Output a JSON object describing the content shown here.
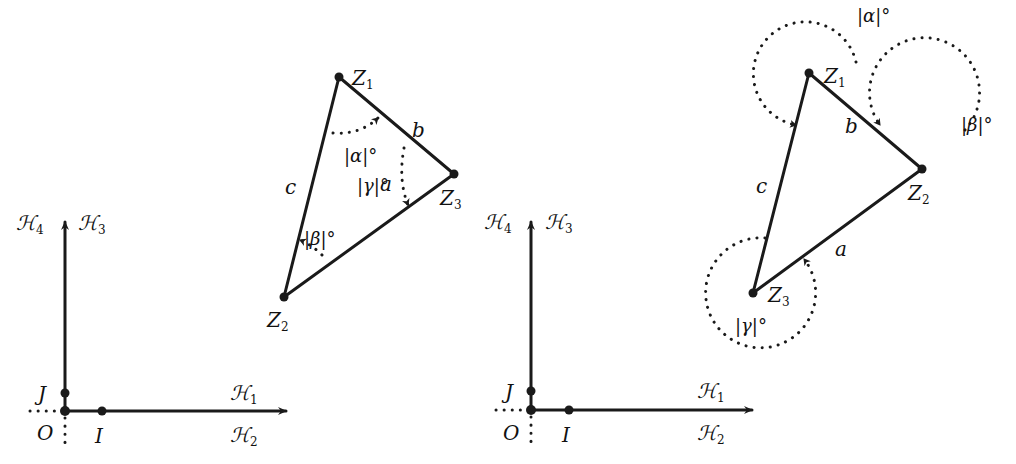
{
  "figure": {
    "panel_left": {
      "axes": {
        "origin": "O",
        "unit_x": "I",
        "unit_y": "J",
        "x_axis_upper": "ℋ",
        "x_axis_upper_sub": "1",
        "x_axis_lower": "ℋ",
        "x_axis_lower_sub": "2",
        "y_axis_right": "ℋ",
        "y_axis_right_sub": "3",
        "y_axis_left": "ℋ",
        "y_axis_left_sub": "4"
      },
      "triangle": {
        "vertices": [
          {
            "name": "Z",
            "sub": "1"
          },
          {
            "name": "Z",
            "sub": "2"
          },
          {
            "name": "Z",
            "sub": "3"
          }
        ],
        "sides": {
          "a": "a",
          "b": "b",
          "c": "c"
        },
        "angles": {
          "alpha": "|α|°",
          "beta": "|β|°",
          "gamma": "|γ|°"
        }
      }
    },
    "panel_right": {
      "axes": {
        "origin": "O",
        "unit_x": "I",
        "unit_y": "J",
        "x_axis_upper": "ℋ",
        "x_axis_upper_sub": "1",
        "x_axis_lower": "ℋ",
        "x_axis_lower_sub": "2",
        "y_axis_right": "ℋ",
        "y_axis_right_sub": "3",
        "y_axis_left": "ℋ",
        "y_axis_left_sub": "4"
      },
      "triangle": {
        "vertices": [
          {
            "name": "Z",
            "sub": "1"
          },
          {
            "name": "Z",
            "sub": "2"
          },
          {
            "name": "Z",
            "sub": "3"
          }
        ],
        "sides": {
          "a": "a",
          "b": "b",
          "c": "c"
        },
        "angles": {
          "alpha": "|α|°",
          "beta": "|β|°",
          "gamma": "|γ|°"
        }
      }
    }
  }
}
